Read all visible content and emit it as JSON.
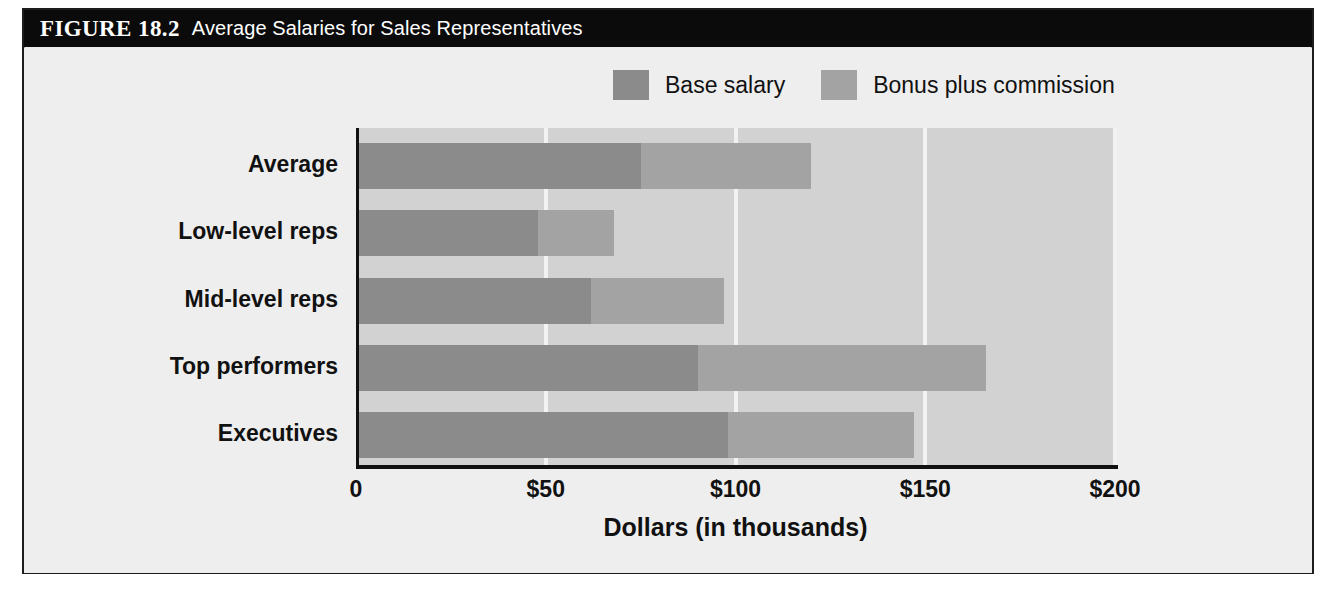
{
  "figure": {
    "number": "FIGURE 18.2",
    "title": "Average Salaries for Sales Representatives"
  },
  "colors": {
    "base_salary": "#8b8b8b",
    "bonus_commission": "#a3a3a3",
    "plot_background": "#d2d2d2",
    "gridline": "#f2f2f2",
    "axis": "#111111",
    "titlebar_background": "#0b0b0b",
    "titlebar_text": "#ffffff",
    "page_background": "#ececec"
  },
  "legend": {
    "items": [
      {
        "label": "Base salary",
        "color": "#8b8b8b",
        "swatch": "legend-swatch-base-salary"
      },
      {
        "label": "Bonus plus commission",
        "color": "#a3a3a3",
        "swatch": "legend-swatch-bonus-commission"
      }
    ]
  },
  "chart_data": {
    "type": "bar",
    "orientation": "horizontal",
    "stacked": true,
    "title": "Average Salaries for Sales Representatives",
    "xlabel": "Dollars (in thousands)",
    "ylabel": "",
    "xlim": [
      0,
      200
    ],
    "xticks": [
      0,
      50,
      100,
      150,
      200
    ],
    "xticklabels": [
      "0",
      "$50",
      "$100",
      "$150",
      "$200"
    ],
    "grid": true,
    "grid_axis": "x",
    "legend_position": "top-right",
    "categories": [
      "Average",
      "Low-level reps",
      "Mid-level reps",
      "Top performers",
      "Executives"
    ],
    "series": [
      {
        "name": "Base salary",
        "color": "#8b8b8b",
        "values": [
          75,
          48,
          62,
          90,
          98
        ]
      },
      {
        "name": "Bonus plus commission",
        "color": "#a3a3a3",
        "values": [
          45,
          20,
          35,
          76,
          49
        ]
      }
    ],
    "totals": [
      120,
      68,
      97,
      166,
      147
    ],
    "units": "thousands of dollars"
  }
}
